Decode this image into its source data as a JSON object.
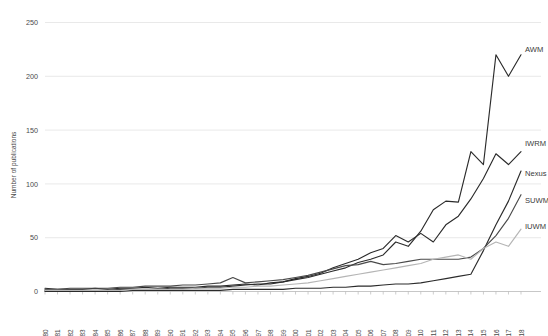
{
  "chart_data": {
    "type": "line",
    "title": "",
    "xlabel": "",
    "ylabel": "Number of publications",
    "ylim": [
      0,
      260
    ],
    "yticks": [
      0,
      50,
      100,
      150,
      200,
      250
    ],
    "grid": true,
    "legend_position": "right-inline-end-labels",
    "x": [
      1980,
      1981,
      1982,
      1983,
      1984,
      1985,
      1986,
      1987,
      1988,
      1989,
      1990,
      1991,
      1992,
      1993,
      1994,
      1995,
      1996,
      1997,
      1998,
      1999,
      2000,
      2001,
      2002,
      2003,
      2004,
      2005,
      2006,
      2007,
      2008,
      2009,
      2010,
      2011,
      2012,
      2013,
      2014,
      2015,
      2016,
      2017,
      2018
    ],
    "categories": [
      "1980",
      "1981",
      "1982",
      "1983",
      "1984",
      "1985",
      "1986",
      "1987",
      "1988",
      "1989",
      "1990",
      "1991",
      "1992",
      "1993",
      "1994",
      "1995",
      "1996",
      "1997",
      "1998",
      "1999",
      "2000",
      "2001",
      "2002",
      "2003",
      "2004",
      "2005",
      "2006",
      "2007",
      "2008",
      "2009",
      "2010",
      "2011",
      "2012",
      "2013",
      "2014",
      "2015",
      "2016",
      "2017",
      "2018"
    ],
    "series": [
      {
        "name": "AWM",
        "color": "#2b2b2b",
        "label": "AWM",
        "values": [
          3,
          2,
          2,
          2,
          3,
          2,
          3,
          3,
          4,
          3,
          4,
          4,
          4,
          5,
          5,
          6,
          7,
          6,
          8,
          9,
          11,
          13,
          16,
          19,
          22,
          27,
          30,
          34,
          46,
          42,
          56,
          76,
          84,
          83,
          130,
          118,
          220,
          200,
          220
        ]
      },
      {
        "name": "IWRM",
        "color": "#2b2b2b",
        "label": "IWRM",
        "values": [
          1,
          1,
          1,
          1,
          1,
          1,
          2,
          2,
          2,
          2,
          3,
          3,
          3,
          4,
          4,
          5,
          6,
          7,
          7,
          9,
          12,
          14,
          17,
          22,
          26,
          30,
          36,
          40,
          52,
          46,
          54,
          46,
          62,
          70,
          86,
          105,
          128,
          118,
          130
        ]
      },
      {
        "name": "Nexus",
        "color": "#2b2b2b",
        "label": "Nexus",
        "values": [
          0,
          0,
          0,
          0,
          0,
          0,
          0,
          1,
          1,
          1,
          1,
          1,
          1,
          1,
          1,
          2,
          2,
          2,
          2,
          2,
          3,
          3,
          3,
          4,
          4,
          5,
          5,
          6,
          7,
          7,
          8,
          10,
          12,
          14,
          16,
          38,
          62,
          84,
          112
        ]
      },
      {
        "name": "SUWM",
        "color": "#4a4a4a",
        "label": "SUWM",
        "values": [
          2,
          2,
          3,
          3,
          3,
          3,
          4,
          4,
          5,
          5,
          5,
          6,
          6,
          7,
          8,
          13,
          8,
          9,
          10,
          11,
          13,
          15,
          18,
          21,
          24,
          25,
          28,
          25,
          26,
          28,
          30,
          30,
          30,
          30,
          32,
          40,
          52,
          68,
          90
        ]
      },
      {
        "name": "IUWM",
        "color": "#b5b5b5",
        "label": "IUWM",
        "values": [
          1,
          1,
          1,
          1,
          1,
          1,
          1,
          2,
          2,
          2,
          2,
          2,
          3,
          3,
          3,
          4,
          4,
          5,
          5,
          6,
          7,
          8,
          10,
          12,
          14,
          16,
          18,
          20,
          22,
          24,
          26,
          30,
          32,
          34,
          30,
          40,
          46,
          42,
          58
        ]
      }
    ],
    "series_end_labels": [
      {
        "name": "AWM",
        "y_px": 52
      },
      {
        "name": "IWRM",
        "y_px": 146
      },
      {
        "name": "Nexus",
        "y_px": 176
      },
      {
        "name": "SUWM",
        "y_px": 203
      },
      {
        "name": "IUWM",
        "y_px": 229
      }
    ]
  },
  "colors": {
    "background": "#ffffff",
    "grid": "#e0e0e0",
    "axis": "#b9b9b9",
    "text": "#4a4a4a"
  }
}
